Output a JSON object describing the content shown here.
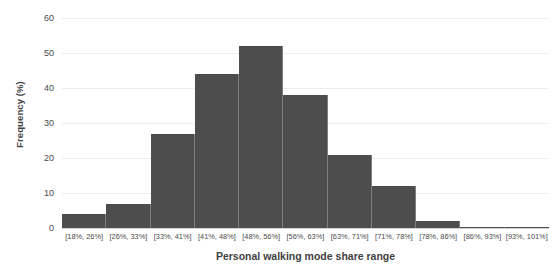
{
  "chart_data": {
    "type": "bar",
    "title": "",
    "xlabel": "Personal walking mode share range",
    "ylabel": "Frequency (%)",
    "categories": [
      "[18%, 26%]",
      "[26%, 33%]",
      "[33%, 41%]",
      "[41%, 48%]",
      "[48%, 56%]",
      "[56%, 63%]",
      "[63%, 71%]",
      "[71%, 78%]",
      "[78%, 86%]",
      "[86%, 93%]",
      "[93%, 101%]"
    ],
    "values": [
      4,
      7,
      27,
      44,
      52,
      38,
      21,
      12,
      2,
      0.4,
      0.4
    ],
    "ylim": [
      0,
      60
    ],
    "yticks": [
      0,
      10,
      20,
      30,
      40,
      50,
      60
    ],
    "ytick_labels": [
      "0",
      "10",
      "20",
      "30",
      "40",
      "50",
      "60"
    ],
    "grid": true,
    "legend": "none",
    "bar_color": "#4d4d4d",
    "gridline_color": "#ededed",
    "background_color": "#ffffff"
  }
}
